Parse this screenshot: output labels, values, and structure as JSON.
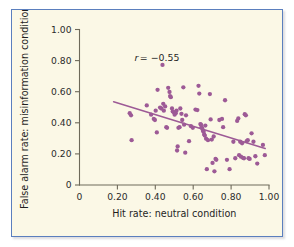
{
  "figure": {
    "background_color": "#fbf8e6",
    "border_color": "#5b7fbe",
    "point_color": "#9d5a96",
    "trendline_color": "#9d5a96",
    "axis_color": "#6e6a5a"
  },
  "annotation": {
    "r_symbol": "r",
    "r_value": "= −0.55",
    "full_text": "r = −0.55"
  },
  "axes": {
    "x_title": "Hit rate: neutral condition",
    "y_title": "False alarm rate: misinformation condition",
    "x_ticks": [
      "0",
      "0.20",
      "0.40",
      "0.60",
      "0.80",
      "1.00"
    ],
    "y_ticks": [
      "0",
      "0.20",
      "0.40",
      "0.60",
      "0.80",
      "1.00"
    ]
  },
  "chart_data": {
    "type": "scatter",
    "title": "",
    "subtitle": "",
    "xlabel": "Hit rate: neutral condition",
    "ylabel": "False alarm rate: misinformation condition",
    "xlim": [
      0,
      1.0
    ],
    "ylim": [
      0,
      1.0
    ],
    "xticks": [
      0,
      0.2,
      0.4,
      0.6,
      0.8,
      1.0
    ],
    "yticks": [
      0,
      0.2,
      0.4,
      0.6,
      0.8,
      1.0
    ],
    "xtick_labels": [
      "0",
      "0.20",
      "0.40",
      "0.60",
      "0.80",
      "1.00"
    ],
    "ytick_labels": [
      "0",
      "0.20",
      "0.40",
      "0.60",
      "0.80",
      "1.00"
    ],
    "grid": false,
    "legend": null,
    "annotations": [
      {
        "text": "r = −0.55",
        "x": 0.29,
        "y": 0.8
      }
    ],
    "correlation_r": -0.55,
    "series": [
      {
        "name": "participants",
        "marker": "circle",
        "color": "#9d5a96",
        "x": [
          0.265,
          0.272,
          0.275,
          0.355,
          0.378,
          0.392,
          0.398,
          0.402,
          0.408,
          0.412,
          0.425,
          0.432,
          0.438,
          0.442,
          0.445,
          0.452,
          0.458,
          0.462,
          0.468,
          0.475,
          0.478,
          0.482,
          0.488,
          0.492,
          0.498,
          0.502,
          0.508,
          0.512,
          0.515,
          0.518,
          0.522,
          0.528,
          0.532,
          0.538,
          0.542,
          0.548,
          0.552,
          0.558,
          0.562,
          0.578,
          0.588,
          0.598,
          0.612,
          0.622,
          0.628,
          0.632,
          0.638,
          0.641,
          0.644,
          0.648,
          0.652,
          0.655,
          0.658,
          0.661,
          0.664,
          0.668,
          0.672,
          0.678,
          0.688,
          0.692,
          0.698,
          0.702,
          0.708,
          0.712,
          0.718,
          0.722,
          0.738,
          0.752,
          0.758,
          0.768,
          0.778,
          0.792,
          0.812,
          0.822,
          0.832,
          0.838,
          0.842,
          0.848,
          0.852,
          0.858,
          0.862,
          0.868,
          0.872,
          0.878,
          0.882,
          0.888,
          0.892,
          0.898,
          0.908,
          0.918,
          0.928,
          0.938,
          0.968,
          0.978
        ],
        "y": [
          0.462,
          0.448,
          0.288,
          0.512,
          0.452,
          0.425,
          0.418,
          0.478,
          0.338,
          0.612,
          0.498,
          0.492,
          0.772,
          0.522,
          0.478,
          0.505,
          0.372,
          0.368,
          0.625,
          0.598,
          0.572,
          0.565,
          0.492,
          0.472,
          0.468,
          0.452,
          0.462,
          0.478,
          0.222,
          0.248,
          0.368,
          0.372,
          0.492,
          0.458,
          0.418,
          0.628,
          0.388,
          0.208,
          0.448,
          0.282,
          0.378,
          0.368,
          0.485,
          0.482,
          0.638,
          0.588,
          0.392,
          0.388,
          0.372,
          0.362,
          0.348,
          0.342,
          0.325,
          0.318,
          0.382,
          0.298,
          0.102,
          0.288,
          0.585,
          0.422,
          0.292,
          0.142,
          0.312,
          0.088,
          0.168,
          0.162,
          0.418,
          0.425,
          0.372,
          0.545,
          0.162,
          0.102,
          0.278,
          0.172,
          0.412,
          0.428,
          0.192,
          0.278,
          0.182,
          0.268,
          0.175,
          0.172,
          0.455,
          0.448,
          0.282,
          0.288,
          0.172,
          0.168,
          0.332,
          0.278,
          0.185,
          0.138,
          0.258,
          0.192
        ]
      }
    ],
    "trendline": {
      "type": "linear-fit",
      "x_start": 0.18,
      "y_start": 0.535,
      "x_end": 0.98,
      "y_end": 0.235
    }
  }
}
